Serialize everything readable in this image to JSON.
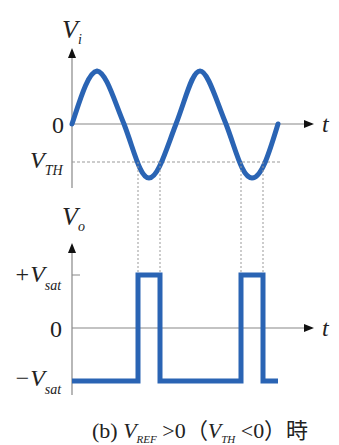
{
  "figure": {
    "top_plot": {
      "y_label": "V",
      "y_label_sub": "i",
      "x_label": "t",
      "zero_label": "0",
      "threshold_label": "V",
      "threshold_label_sub": "TH"
    },
    "bottom_plot": {
      "y_label": "V",
      "y_label_sub": "o",
      "x_label": "t",
      "pos_sat_label": "+V",
      "pos_sat_sub": "sat",
      "zero_label": "0",
      "neg_sat_label": "−V",
      "neg_sat_sub": "sat"
    },
    "caption": {
      "prefix": "(b) ",
      "vref": "V",
      "vref_sub": "REF",
      "cond1": " >0（",
      "vth": "V",
      "vth_sub": "TH",
      "cond2": " <0）時"
    },
    "colors": {
      "waveform": "#2a64b4",
      "axis": "#888888",
      "dashed": "#999999",
      "text": "#222222"
    }
  }
}
